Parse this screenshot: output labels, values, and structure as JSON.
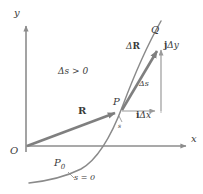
{
  "figure": {
    "type": "vector-calculus-diagram",
    "width": 203,
    "height": 194,
    "background_color": "#ffffff"
  },
  "colors": {
    "axis": "#8c8c8c",
    "curve": "#8a8a8a",
    "vector": "#7f7f7f",
    "thin_line": "#b0b0b0",
    "text": "#3a3a3a"
  },
  "axes": {
    "y_label": "y",
    "x_label": "x",
    "origin_label": "O",
    "origin_px": {
      "x": 26,
      "y": 146
    },
    "x_axis": {
      "x1": 26,
      "y1": 146,
      "x2": 190,
      "y2": 146
    },
    "y_axis": {
      "x1": 26,
      "y1": 148,
      "x2": 26,
      "y2": 22
    }
  },
  "points": {
    "P": {
      "label": "P",
      "px": {
        "x": 121,
        "y": 110
      }
    },
    "Q": {
      "label": "Q",
      "px": {
        "x": 161,
        "y": 40
      }
    },
    "P0": {
      "label": "P_0",
      "display": "P",
      "subscript": "0",
      "px": {
        "x": 72,
        "y": 176
      }
    }
  },
  "arc_labels": {
    "s_at_P": "s",
    "s_at_P0": "s = 0"
  },
  "vectors": {
    "position_vector": {
      "label": "R",
      "bold": true,
      "from": {
        "x": 26,
        "y": 146
      },
      "to": {
        "x": 121,
        "y": 110
      }
    },
    "increment_vector": {
      "label": "ΔR",
      "delta": "Δ",
      "symbol": "R",
      "bold": true,
      "from": {
        "x": 121,
        "y": 110
      },
      "to": {
        "x": 161,
        "y": 44
      }
    },
    "i_component": {
      "label": "iΔx",
      "symbol": "i",
      "delta": "Δ",
      "variable": "x",
      "from": {
        "x": 121,
        "y": 112
      },
      "to": {
        "x": 161,
        "y": 112
      }
    },
    "j_component": {
      "label": "jΔy",
      "symbol": "j",
      "delta": "Δ",
      "variable": "y",
      "from": {
        "x": 161,
        "y": 112
      },
      "to": {
        "x": 161,
        "y": 44
      }
    }
  },
  "annotations": {
    "delta_s": "Δs",
    "delta_s_positive": "Δs > 0"
  },
  "curve": {
    "description": "upward-opening curve passing through P0 and P toward Q",
    "path": "M 29,183 C 48,180 66,176 82,168 C 98,159 112,136 124,104 C 136,72 148,44 160,22"
  }
}
